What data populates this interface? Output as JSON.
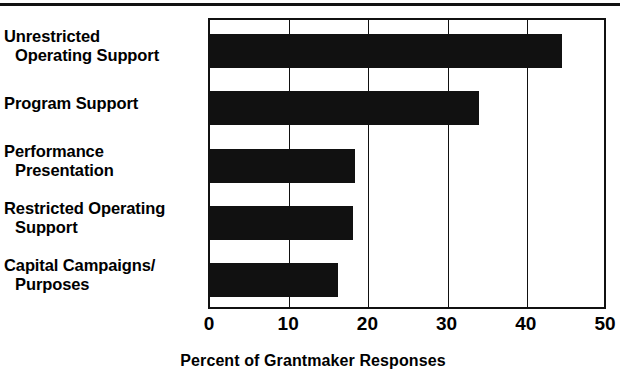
{
  "chart_data": {
    "type": "bar",
    "orientation": "horizontal",
    "title": "",
    "xlabel": "Percent of Grantmaker Responses",
    "ylabel": "",
    "xlim": [
      0,
      50
    ],
    "xticks": [
      0,
      10,
      20,
      30,
      40,
      50
    ],
    "xtick_labels": [
      "0",
      "10",
      "20",
      "30",
      "40",
      "50"
    ],
    "grid": "vertical",
    "legend": "none",
    "bar_color": "#111111",
    "categories": [
      "Unrestricted Operating Support",
      "Program Support",
      "Performance Presentation",
      "Restricted Operating Support",
      "Capital Campaigns/ Purposes"
    ],
    "category_lines": [
      [
        "Unrestricted",
        "Operating Support"
      ],
      [
        "Program Support",
        ""
      ],
      [
        "Performance",
        "Presentation"
      ],
      [
        "Restricted Operating",
        "Support"
      ],
      [
        "Capital Campaigns/",
        "Purposes"
      ]
    ],
    "values": [
      44.4,
      34.0,
      18.3,
      18.0,
      16.2
    ]
  },
  "figure": {
    "top_rule": "horizontal-rule"
  }
}
